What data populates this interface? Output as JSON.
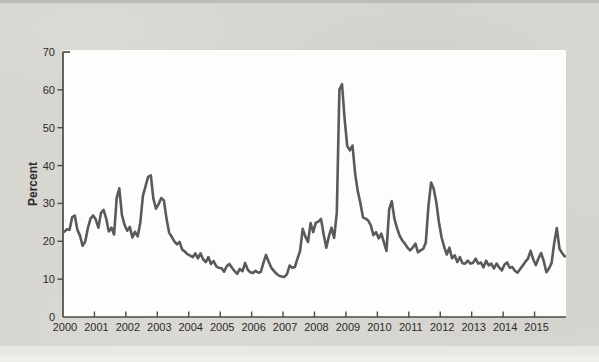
{
  "chart_data": {
    "type": "line",
    "title": "",
    "xlabel": "",
    "ylabel": "Percent",
    "ylim": [
      0,
      70
    ],
    "y_ticks": [
      0,
      10,
      20,
      30,
      40,
      50,
      60,
      70
    ],
    "x_tick_labels": [
      "2000",
      "2001",
      "2002",
      "2003",
      "2004",
      "2005",
      "2006",
      "2007",
      "2008",
      "2009",
      "2010",
      "2011",
      "2012",
      "2013",
      "2014",
      "2015"
    ],
    "grid": false,
    "legend": "none",
    "line_color": "#5a5a5a",
    "axis_color": "#4a4a48",
    "frequency": "monthly",
    "x_start_year": 2000,
    "x_end_year": 2016,
    "series": [
      {
        "name": "volatility-percent",
        "values": [
          22.5,
          23.2,
          23.0,
          26.4,
          26.8,
          23.0,
          21.5,
          18.8,
          20.0,
          23.5,
          26.0,
          26.8,
          25.8,
          23.6,
          27.5,
          28.3,
          26.0,
          22.6,
          23.6,
          21.8,
          31.5,
          34.0,
          27.0,
          24.3,
          22.8,
          23.8,
          21.0,
          22.5,
          21.3,
          25.0,
          32.0,
          34.5,
          37.0,
          37.4,
          31.2,
          28.6,
          29.8,
          31.4,
          30.8,
          26.0,
          22.3,
          21.2,
          20.0,
          19.2,
          19.8,
          17.8,
          17.3,
          16.6,
          16.2,
          15.8,
          16.8,
          15.5,
          16.8,
          15.2,
          14.5,
          15.8,
          14.0,
          14.8,
          13.4,
          13.0,
          12.9,
          12.0,
          13.4,
          14.0,
          13.0,
          12.1,
          11.4,
          12.7,
          12.1,
          14.3,
          12.5,
          11.8,
          11.6,
          12.2,
          11.7,
          11.9,
          14.3,
          16.4,
          14.6,
          13.0,
          12.2,
          11.4,
          10.9,
          10.7,
          10.6,
          11.3,
          13.6,
          13.0,
          13.2,
          15.4,
          17.5,
          23.3,
          21.3,
          19.8,
          24.8,
          22.4,
          24.9,
          25.2,
          25.9,
          21.8,
          18.3,
          21.3,
          23.6,
          20.9,
          27.5,
          60.0,
          61.5,
          52.4,
          45.2,
          44.0,
          45.3,
          38.0,
          33.3,
          30.2,
          26.3,
          26.0,
          25.5,
          24.2,
          21.6,
          22.4,
          20.8,
          22.0,
          19.7,
          17.5,
          28.5,
          30.6,
          26.0,
          23.5,
          21.5,
          20.2,
          19.4,
          18.3,
          17.6,
          18.3,
          19.4,
          17.1,
          17.6,
          18.0,
          19.7,
          29.5,
          35.5,
          33.9,
          30.3,
          25.1,
          21.0,
          18.5,
          16.5,
          18.3,
          15.5,
          16.3,
          14.5,
          15.8,
          14.2,
          14.1,
          14.9,
          14.1,
          14.3,
          15.4,
          14.1,
          14.4,
          13.1,
          14.9,
          13.6,
          14.1,
          12.8,
          14.1,
          13.1,
          12.3,
          13.8,
          14.4,
          13.0,
          13.2,
          12.2,
          11.7,
          12.7,
          13.6,
          14.6,
          15.4,
          17.5,
          15.2,
          13.7,
          15.5,
          16.9,
          14.8,
          11.8,
          12.8,
          14.3,
          19.5,
          23.5,
          18.0,
          16.9,
          16.0
        ]
      }
    ]
  }
}
